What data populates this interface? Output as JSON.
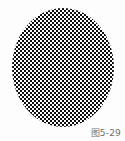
{
  "figure": {
    "caption": "图5-29",
    "caption_label_latin": "Fig. 5-29",
    "background_color": "#fdfdfd"
  },
  "pattern": {
    "name": "checkerboard",
    "shape": "ellipse",
    "fill_dark_color": "#0d0d0d",
    "fill_light_color": "#ffffff",
    "cell_size_px": 2,
    "shape_width_px": 102,
    "shape_height_px": 119,
    "shape_left_px": 12,
    "shape_top_px": 8
  }
}
